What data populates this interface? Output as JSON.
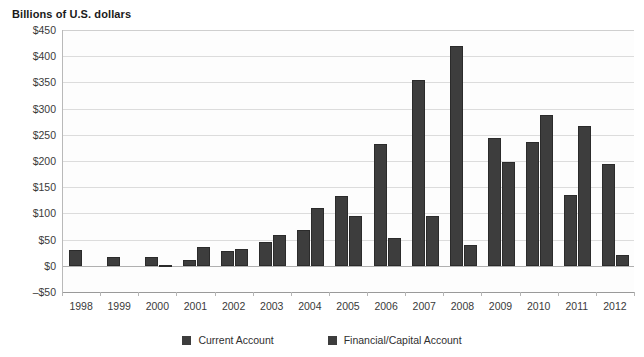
{
  "chart_data": {
    "type": "bar",
    "title": "Billions of U.S. dollars",
    "subtitle": "",
    "xlabel": "",
    "ylabel": "Billions of U.S. dollars",
    "ylim": [
      -50,
      450
    ],
    "ytick_step": 50,
    "grid": true,
    "legend_position": "bottom",
    "categories": [
      "1998",
      "1999",
      "2000",
      "2001",
      "2002",
      "2003",
      "2004",
      "2005",
      "2006",
      "2007",
      "2008",
      "2009",
      "2010",
      "2011",
      "2012"
    ],
    "ytick_labels": [
      "$450",
      "$400",
      "$350",
      "$300",
      "$250",
      "$200",
      "$150",
      "$100",
      "$50",
      "$0",
      "–$50"
    ],
    "ytick_values": [
      450,
      400,
      350,
      300,
      250,
      200,
      150,
      100,
      50,
      0,
      -50
    ],
    "series": [
      {
        "name": "Current Account",
        "color": "#3d3d3d",
        "values": [
          30,
          16,
          17,
          12,
          28,
          46,
          69,
          133,
          233,
          355,
          420,
          243,
          237,
          136,
          195
        ]
      },
      {
        "name": "Financial/Capital Account",
        "color": "#3d3d3d",
        "values": [
          0,
          0,
          2,
          35,
          33,
          59,
          111,
          95,
          53,
          95,
          40,
          199,
          287,
          266,
          20
        ]
      }
    ]
  },
  "legend": {
    "items": [
      {
        "label": "Current Account"
      },
      {
        "label": "Financial/Capital Account"
      }
    ]
  },
  "colors": {
    "bar": "#3d3d3d",
    "grid": "#dcdcdc",
    "axis": "#9a9a9a",
    "text": "#3a3a3a"
  }
}
